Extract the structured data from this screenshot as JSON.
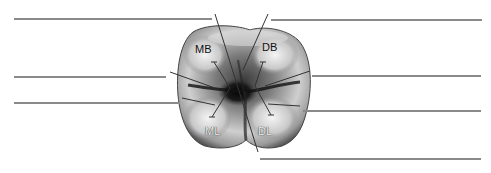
{
  "diagram": {
    "cusp_labels": [
      {
        "id": "mb",
        "text": "MB",
        "x": 195,
        "y": 43
      },
      {
        "id": "db",
        "text": "DB",
        "x": 262,
        "y": 42
      },
      {
        "id": "ml",
        "text": "ML",
        "x": 205,
        "y": 126
      },
      {
        "id": "dl",
        "text": "DL",
        "x": 258,
        "y": 126
      }
    ],
    "answer_lines": [
      {
        "id": "line-1",
        "x1": 14,
        "x2": 212,
        "y": 19,
        "value": ""
      },
      {
        "id": "line-2",
        "x1": 271,
        "x2": 482,
        "y": 20,
        "value": ""
      },
      {
        "id": "line-3",
        "x1": 14,
        "x2": 166,
        "y": 77,
        "value": ""
      },
      {
        "id": "line-4",
        "x1": 14,
        "x2": 180,
        "y": 103,
        "value": ""
      },
      {
        "id": "line-5",
        "x1": 312,
        "x2": 481,
        "y": 76,
        "value": ""
      },
      {
        "id": "line-6",
        "x1": 303,
        "x2": 481,
        "y": 111,
        "value": ""
      },
      {
        "id": "line-7",
        "x1": 260,
        "x2": 481,
        "y": 159,
        "value": ""
      }
    ],
    "colors": {
      "answer_line": "#8a8a8a",
      "leader_line": "#333333",
      "background": "#ffffff"
    }
  }
}
